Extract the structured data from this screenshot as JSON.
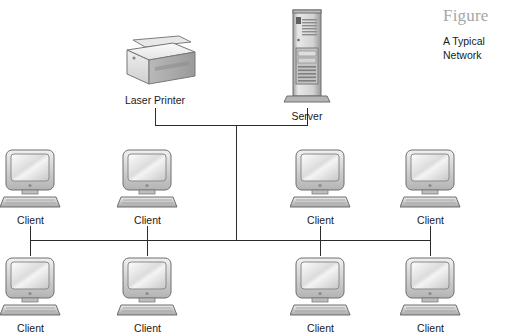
{
  "figure": {
    "heading": "Figure",
    "caption": "A Typical Network"
  },
  "colors": {
    "background": "#ffffff",
    "wire": "#2b2b2b",
    "label_text": "#1a1a1a",
    "figure_heading": "#a6a6a6",
    "device_light": "#f2f2f2",
    "device_mid": "#c9c9c9",
    "device_dark": "#8a8a8a",
    "device_outline": "#6e6e6e"
  },
  "diagram": {
    "type": "network-topology",
    "topology": "bus",
    "devices": [
      {
        "id": "printer",
        "kind": "laser-printer",
        "label": "Laser Printer",
        "row": "top",
        "cx": 155
      },
      {
        "id": "server",
        "kind": "server-tower",
        "label": "Server",
        "row": "top",
        "cx": 307
      },
      {
        "id": "client-1",
        "kind": "desktop-computer",
        "label": "Client",
        "row": "middle",
        "cx": 30
      },
      {
        "id": "client-2",
        "kind": "desktop-computer",
        "label": "Client",
        "row": "middle",
        "cx": 147
      },
      {
        "id": "client-3",
        "kind": "desktop-computer",
        "label": "Client",
        "row": "middle",
        "cx": 320
      },
      {
        "id": "client-4",
        "kind": "desktop-computer",
        "label": "Client",
        "row": "middle",
        "cx": 430
      },
      {
        "id": "client-5",
        "kind": "desktop-computer",
        "label": "Client",
        "row": "bottom",
        "cx": 30
      },
      {
        "id": "client-6",
        "kind": "desktop-computer",
        "label": "Client",
        "row": "bottom",
        "cx": 147
      },
      {
        "id": "client-7",
        "kind": "desktop-computer",
        "label": "Client",
        "row": "bottom",
        "cx": 320
      },
      {
        "id": "client-8",
        "kind": "desktop-computer",
        "label": "Client",
        "row": "bottom",
        "cx": 430
      }
    ],
    "labels": {
      "printer": "Laser Printer",
      "server": "Server",
      "client": "Client"
    },
    "counts": {
      "printers": 1,
      "servers": 1,
      "clients": 8
    }
  }
}
